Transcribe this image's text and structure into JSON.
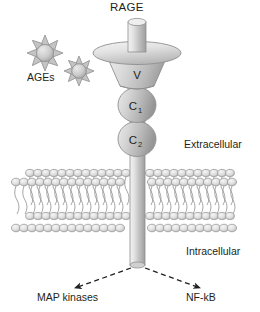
{
  "figure": {
    "type": "biological-schematic",
    "background_color": "#ffffff",
    "line_color": "#6f7072",
    "text_color": "#231f20",
    "fill_light": "#e8e8e8",
    "fill_mid": "#c9c9c9",
    "fill_dark": "#a8a8a8"
  },
  "labels": {
    "receptor_name": "RAGE",
    "ligand_name": "AGEs",
    "extracellular": "Extracellular",
    "intracellular": "Intracellular",
    "domain_v": "V",
    "domain_c1_base": "C",
    "domain_c1_sub": "1",
    "domain_c2_base": "C",
    "domain_c2_sub": "2",
    "target_left": "MAP kinases",
    "target_right": "NF-kB"
  },
  "structures": {
    "ligands": [
      {
        "name": "age-particle-1",
        "cx": 45,
        "cy": 53,
        "r": 11,
        "spikes": 8
      },
      {
        "name": "age-particle-2",
        "cx": 78,
        "cy": 70,
        "r": 9,
        "spikes": 8
      }
    ],
    "receptor": {
      "stalk_top": {
        "x": 128,
        "y": 18,
        "w": 18,
        "h": 36
      },
      "cap_ellipse": {
        "cx": 137,
        "cy": 53,
        "rx": 43,
        "ry": 11
      },
      "v_domain": {
        "top_w": 62,
        "bottom_w": 34,
        "y_top": 56,
        "y_bottom": 90
      },
      "c1_domain": {
        "cx": 137,
        "cy": 105,
        "rx": 19,
        "ry": 17
      },
      "c2_domain": {
        "cx": 137,
        "cy": 139,
        "rx": 19,
        "ry": 17
      },
      "transmembrane": {
        "x": 130,
        "y": 155,
        "w": 15,
        "h": 110
      }
    },
    "membrane": {
      "x_left": 12,
      "x_right": 238,
      "y_top": 165,
      "y_bottom": 236,
      "leaflets": 2,
      "lipid_count": 26
    },
    "arrows": [
      {
        "name": "arrow-to-map-kinases",
        "from": [
          131,
          266
        ],
        "to": [
          72,
          289
        ],
        "style": "dashed"
      },
      {
        "name": "arrow-to-nf-kb",
        "from": [
          144,
          266
        ],
        "to": [
          202,
          289
        ],
        "style": "dashed"
      }
    ]
  }
}
